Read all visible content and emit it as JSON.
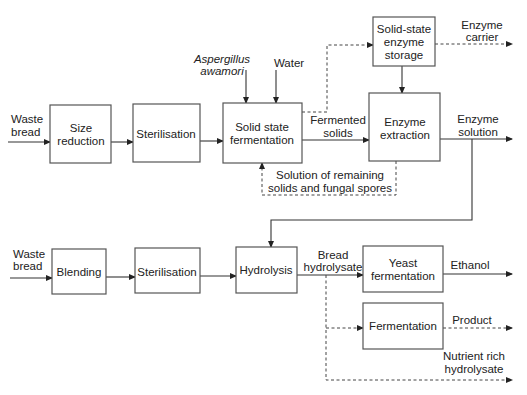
{
  "diagram": {
    "type": "process-flow",
    "boxes": {
      "size_reduction": [
        "Size",
        "reduction"
      ],
      "sterilisation_1": [
        "Sterilisation"
      ],
      "ssf": [
        "Solid state",
        "fermentation"
      ],
      "storage": [
        "Solid-state",
        "enzyme",
        "storage"
      ],
      "extraction": [
        "Enzyme",
        "extraction"
      ],
      "blending": [
        "Blending"
      ],
      "sterilisation_2": [
        "Sterilisation"
      ],
      "hydrolysis": [
        "Hydrolysis"
      ],
      "yeast_fermentation": [
        "Yeast",
        "fermentation"
      ],
      "fermentation": [
        "Fermentation"
      ]
    },
    "labels": {
      "waste_bread_1": [
        "Waste",
        "bread"
      ],
      "aspergillus": [
        "Aspergillus",
        "awamori"
      ],
      "water": [
        "Water"
      ],
      "fermented_solids": [
        "Fermented",
        "solids"
      ],
      "enzyme_carrier": [
        "Enzyme",
        "carrier"
      ],
      "enzyme_solution": [
        "Enzyme",
        "solution"
      ],
      "recycle": [
        "Solution of remaining",
        "solids and fungal spores"
      ],
      "waste_bread_2": [
        "Waste",
        "bread"
      ],
      "bread_hydrolysate": [
        "Bread",
        "hydrolysate"
      ],
      "ethanol": [
        "Ethanol"
      ],
      "product": [
        "Product"
      ],
      "nutrient": [
        "Nutrient rich",
        "hydrolysate"
      ]
    }
  }
}
